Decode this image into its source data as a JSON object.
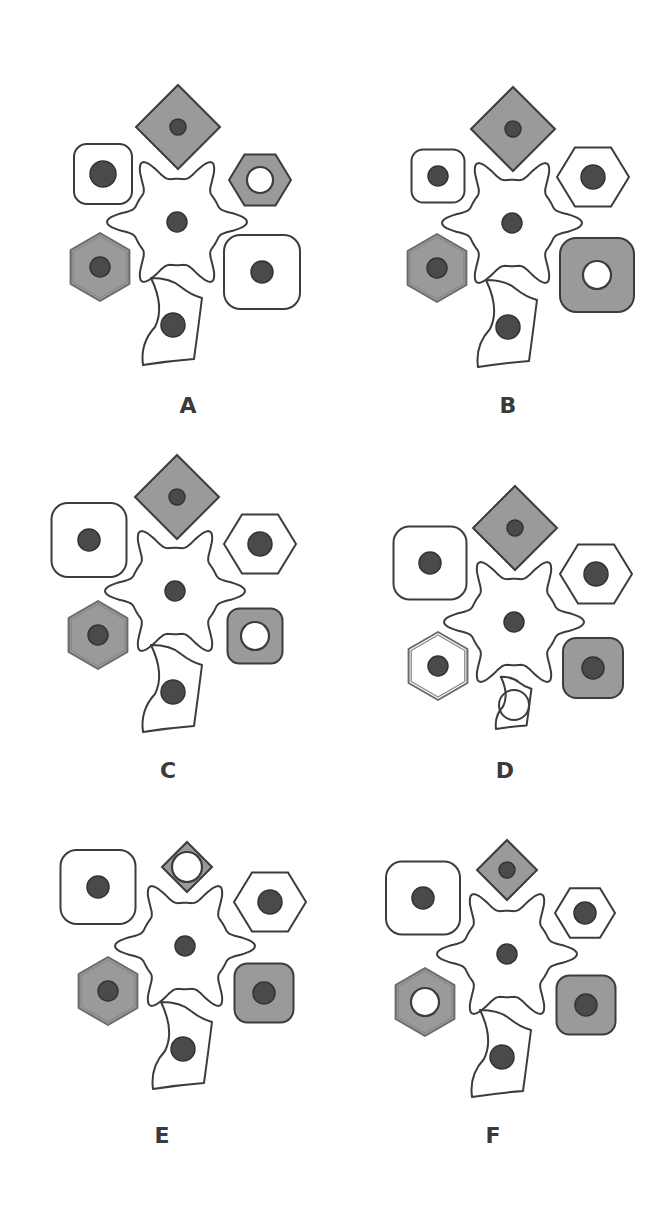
{
  "colors": {
    "background": "#ffffff",
    "outline": "#3c3c3c",
    "cell_gray": "#9a9a9a",
    "cell_white": "#ffffff",
    "nucleus": "#4a4a4a",
    "nucleus_outline": "#333333"
  },
  "panels": [
    {
      "label": "A",
      "label_pos": [
        168,
        393
      ],
      "cells": [
        {
          "type": "diamond",
          "cx": 178,
          "cy": 127,
          "r": 42,
          "fill": "gray",
          "nucleus": "dark",
          "nr": 8
        },
        {
          "type": "rsquare",
          "cx": 103,
          "cy": 174,
          "w": 58,
          "h": 60,
          "fill": "white",
          "nucleus": "dark",
          "nr": 13
        },
        {
          "type": "hexagon",
          "cx": 260,
          "cy": 180,
          "r": 31,
          "fill": "gray",
          "nucleus": "ring",
          "nr": 13
        },
        {
          "type": "star",
          "cx": 177,
          "cy": 222,
          "r": 70,
          "fill": "white",
          "nucleus": "dark",
          "nr": 10
        },
        {
          "type": "hexagon2",
          "cx": 100,
          "cy": 267,
          "r": 34,
          "fill": "gray",
          "nucleus": "dark",
          "nr": 10
        },
        {
          "type": "rsquare",
          "cx": 262,
          "cy": 272,
          "w": 76,
          "h": 74,
          "fill": "white",
          "nucleus": "dark",
          "nr": 11
        },
        {
          "type": "bottom",
          "cx": 173,
          "cy": 325,
          "s": 1,
          "fill": "white",
          "nucleus": "dark",
          "nr": 12
        }
      ]
    },
    {
      "label": "B",
      "label_pos": [
        488,
        393
      ],
      "cells": [
        {
          "type": "diamond",
          "cx": 513,
          "cy": 129,
          "r": 42,
          "fill": "gray",
          "nucleus": "dark",
          "nr": 8
        },
        {
          "type": "rsquare",
          "cx": 438,
          "cy": 176,
          "w": 53,
          "h": 53,
          "fill": "white",
          "nucleus": "dark",
          "nr": 10
        },
        {
          "type": "hexagon",
          "cx": 593,
          "cy": 177,
          "r": 36,
          "fill": "white",
          "nucleus": "dark",
          "nr": 12
        },
        {
          "type": "star",
          "cx": 512,
          "cy": 223,
          "r": 70,
          "fill": "white",
          "nucleus": "dark",
          "nr": 10
        },
        {
          "type": "hexagon2",
          "cx": 437,
          "cy": 268,
          "r": 34,
          "fill": "gray",
          "nucleus": "dark",
          "nr": 10
        },
        {
          "type": "rsquare",
          "cx": 597,
          "cy": 275,
          "w": 74,
          "h": 74,
          "fill": "gray",
          "nucleus": "ring",
          "nr": 14
        },
        {
          "type": "bottom",
          "cx": 508,
          "cy": 327,
          "s": 1,
          "fill": "white",
          "nucleus": "dark",
          "nr": 12
        }
      ]
    },
    {
      "label": "C",
      "label_pos": [
        148,
        758
      ],
      "cells": [
        {
          "type": "diamond",
          "cx": 177,
          "cy": 497,
          "r": 42,
          "fill": "gray",
          "nucleus": "dark",
          "nr": 8
        },
        {
          "type": "rsquare",
          "cx": 89,
          "cy": 540,
          "w": 75,
          "h": 74,
          "fill": "white",
          "nucleus": "dark",
          "nr": 11
        },
        {
          "type": "hexagon",
          "cx": 260,
          "cy": 544,
          "r": 36,
          "fill": "white",
          "nucleus": "dark",
          "nr": 12
        },
        {
          "type": "star",
          "cx": 175,
          "cy": 591,
          "r": 70,
          "fill": "white",
          "nucleus": "dark",
          "nr": 10
        },
        {
          "type": "hexagon2",
          "cx": 98,
          "cy": 635,
          "r": 34,
          "fill": "gray",
          "nucleus": "dark",
          "nr": 10
        },
        {
          "type": "rsquare",
          "cx": 255,
          "cy": 636,
          "w": 55,
          "h": 55,
          "fill": "gray",
          "nucleus": "ring",
          "nr": 14
        },
        {
          "type": "bottom",
          "cx": 173,
          "cy": 692,
          "s": 1,
          "fill": "white",
          "nucleus": "dark",
          "nr": 12
        }
      ]
    },
    {
      "label": "D",
      "label_pos": [
        485,
        758
      ],
      "cells": [
        {
          "type": "diamond",
          "cx": 515,
          "cy": 528,
          "r": 42,
          "fill": "gray",
          "nucleus": "dark",
          "nr": 8
        },
        {
          "type": "rsquare",
          "cx": 430,
          "cy": 563,
          "w": 73,
          "h": 73,
          "fill": "white",
          "nucleus": "dark",
          "nr": 11
        },
        {
          "type": "hexagon",
          "cx": 596,
          "cy": 574,
          "r": 36,
          "fill": "white",
          "nucleus": "dark",
          "nr": 12
        },
        {
          "type": "star",
          "cx": 514,
          "cy": 622,
          "r": 70,
          "fill": "white",
          "nucleus": "dark",
          "nr": 10
        },
        {
          "type": "hexagon2",
          "cx": 438,
          "cy": 666,
          "r": 34,
          "fill": "white",
          "nucleus": "dark",
          "nr": 10
        },
        {
          "type": "rsquare",
          "cx": 593,
          "cy": 668,
          "w": 60,
          "h": 60,
          "fill": "gray",
          "nucleus": "dark",
          "nr": 11
        },
        {
          "type": "bottom",
          "cx": 514,
          "cy": 705,
          "s": 0.6,
          "fill": "white",
          "nucleus": "ring-open",
          "nr": 15
        }
      ]
    },
    {
      "label": "E",
      "label_pos": [
        142,
        1123
      ],
      "cells": [
        {
          "type": "diamond",
          "cx": 187,
          "cy": 867,
          "r": 25,
          "fill": "gray",
          "nucleus": "ring",
          "nr": 15
        },
        {
          "type": "rsquare",
          "cx": 98,
          "cy": 887,
          "w": 75,
          "h": 74,
          "fill": "white",
          "nucleus": "dark",
          "nr": 11
        },
        {
          "type": "hexagon",
          "cx": 270,
          "cy": 902,
          "r": 36,
          "fill": "white",
          "nucleus": "dark",
          "nr": 12
        },
        {
          "type": "star",
          "cx": 185,
          "cy": 946,
          "r": 70,
          "fill": "white",
          "nucleus": "dark",
          "nr": 10
        },
        {
          "type": "hexagon2",
          "cx": 108,
          "cy": 991,
          "r": 34,
          "fill": "gray",
          "nucleus": "dark",
          "nr": 10
        },
        {
          "type": "rsquare",
          "cx": 264,
          "cy": 993,
          "w": 59,
          "h": 59,
          "fill": "gray",
          "nucleus": "dark",
          "nr": 11
        },
        {
          "type": "bottom",
          "cx": 183,
          "cy": 1049,
          "s": 1,
          "fill": "white",
          "nucleus": "dark",
          "nr": 12
        }
      ]
    },
    {
      "label": "F",
      "label_pos": [
        473,
        1123
      ],
      "cells": [
        {
          "type": "diamond",
          "cx": 507,
          "cy": 870,
          "r": 30,
          "fill": "gray",
          "nucleus": "dark",
          "nr": 8
        },
        {
          "type": "rsquare",
          "cx": 423,
          "cy": 898,
          "w": 74,
          "h": 73,
          "fill": "white",
          "nucleus": "dark",
          "nr": 11
        },
        {
          "type": "hexagon",
          "cx": 585,
          "cy": 913,
          "r": 30,
          "fill": "white",
          "nucleus": "dark",
          "nr": 11
        },
        {
          "type": "star",
          "cx": 507,
          "cy": 954,
          "r": 70,
          "fill": "white",
          "nucleus": "dark",
          "nr": 10
        },
        {
          "type": "hexagon2",
          "cx": 425,
          "cy": 1002,
          "r": 34,
          "fill": "gray",
          "nucleus": "ring",
          "nr": 14
        },
        {
          "type": "rsquare",
          "cx": 586,
          "cy": 1005,
          "w": 59,
          "h": 59,
          "fill": "gray",
          "nucleus": "dark",
          "nr": 11
        },
        {
          "type": "bottom",
          "cx": 502,
          "cy": 1057,
          "s": 1,
          "fill": "white",
          "nucleus": "dark",
          "nr": 12
        }
      ]
    }
  ]
}
